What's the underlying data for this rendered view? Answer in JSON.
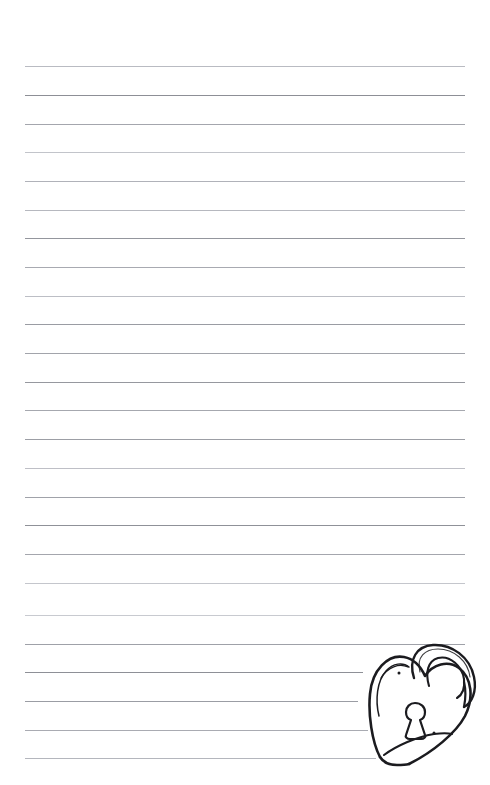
{
  "page": {
    "name": "lined-notebook-page",
    "width": 490,
    "height": 785,
    "background_color": "#ffffff",
    "paper_type": "ruled writing paper",
    "text_content": "",
    "margin_left_px": 25,
    "margin_right_px": 465
  },
  "ruling": {
    "line_color_dark": "#8d8f96",
    "line_color_mid": "#a9abb2",
    "line_color_light": "#c9cbd1",
    "line_count": 25,
    "spacing_px": 28.7,
    "first_line_y": 66,
    "lines": [
      {
        "y": 66,
        "x1": 25,
        "x2": 465,
        "color": "#b9bbc2",
        "weight": 1
      },
      {
        "y": 95,
        "x1": 25,
        "x2": 465,
        "color": "#8d8f96",
        "weight": 1
      },
      {
        "y": 124,
        "x1": 25,
        "x2": 465,
        "color": "#a4a6ad",
        "weight": 1
      },
      {
        "y": 152,
        "x1": 25,
        "x2": 465,
        "color": "#c2c4ca",
        "weight": 1
      },
      {
        "y": 181,
        "x1": 25,
        "x2": 465,
        "color": "#b0b2b9",
        "weight": 1
      },
      {
        "y": 210,
        "x1": 25,
        "x2": 465,
        "color": "#b6b8bf",
        "weight": 1
      },
      {
        "y": 238,
        "x1": 25,
        "x2": 465,
        "color": "#94969d",
        "weight": 1
      },
      {
        "y": 267,
        "x1": 25,
        "x2": 465,
        "color": "#a8aab1",
        "weight": 1
      },
      {
        "y": 296,
        "x1": 25,
        "x2": 465,
        "color": "#bcbec5",
        "weight": 1
      },
      {
        "y": 324,
        "x1": 25,
        "x2": 465,
        "color": "#9a9ca3",
        "weight": 1
      },
      {
        "y": 353,
        "x1": 25,
        "x2": 465,
        "color": "#a2a4ab",
        "weight": 1
      },
      {
        "y": 382,
        "x1": 25,
        "x2": 465,
        "color": "#96989f",
        "weight": 1
      },
      {
        "y": 410,
        "x1": 25,
        "x2": 465,
        "color": "#a6a8af",
        "weight": 1
      },
      {
        "y": 439,
        "x1": 25,
        "x2": 465,
        "color": "#9c9ea5",
        "weight": 1
      },
      {
        "y": 468,
        "x1": 25,
        "x2": 465,
        "color": "#bebfc6",
        "weight": 1
      },
      {
        "y": 497,
        "x1": 25,
        "x2": 465,
        "color": "#a0a2a9",
        "weight": 1
      },
      {
        "y": 525,
        "x1": 25,
        "x2": 465,
        "color": "#8f9198",
        "weight": 1
      },
      {
        "y": 554,
        "x1": 25,
        "x2": 465,
        "color": "#a4a6ad",
        "weight": 1
      },
      {
        "y": 583,
        "x1": 25,
        "x2": 465,
        "color": "#c4c6cc",
        "weight": 1
      },
      {
        "y": 615,
        "x1": 25,
        "x2": 465,
        "color": "#c8cad0",
        "weight": 1
      },
      {
        "y": 644,
        "x1": 25,
        "x2": 465,
        "color": "#9fa1a8",
        "weight": 1
      },
      {
        "y": 672,
        "x1": 25,
        "x2": 363,
        "color": "#8e9097",
        "weight": 1
      },
      {
        "y": 701,
        "x1": 25,
        "x2": 358,
        "color": "#9b9da4",
        "weight": 1
      },
      {
        "y": 730,
        "x1": 25,
        "x2": 368,
        "color": "#a9abb2",
        "weight": 1
      },
      {
        "y": 758,
        "x1": 25,
        "x2": 376,
        "color": "#b4b6bd",
        "weight": 1
      }
    ]
  },
  "doodle": {
    "name": "heart-padlock-doodle",
    "description": "Hand-drawn heart-shaped padlock (love lock) with an arched shackle and a keyhole",
    "ink_color": "#1b1b1f",
    "position": {
      "x": 362,
      "y": 646,
      "width": 118,
      "height": 122
    },
    "parts": [
      {
        "name": "heart-body",
        "label": "heart-shaped lock body"
      },
      {
        "name": "shackle",
        "label": "arched shackle loop"
      },
      {
        "name": "keyhole",
        "label": "keyhole"
      },
      {
        "name": "inner-contour",
        "label": "inner highlight line"
      },
      {
        "name": "bottom-fold",
        "label": "bottom fold sweep"
      },
      {
        "name": "accent-dots",
        "label": "small ink dots"
      }
    ]
  }
}
